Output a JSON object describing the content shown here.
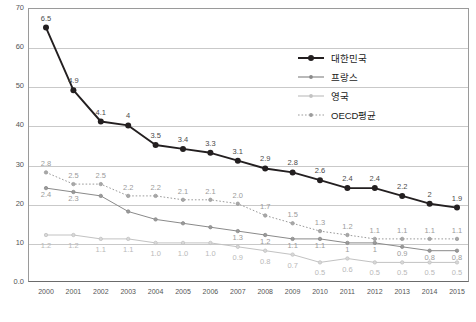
{
  "chart_data": {
    "type": "line",
    "title": "",
    "xlabel": "",
    "ylabel": "",
    "categories": [
      "2000",
      "2001",
      "2002",
      "2003",
      "2004",
      "2005",
      "2006",
      "2007",
      "2008",
      "2009",
      "2010",
      "2011",
      "2012",
      "2013",
      "2014",
      "2015"
    ],
    "ylim": [
      0,
      70
    ],
    "yticks": [
      "0.0",
      "10",
      "20",
      "30",
      "40",
      "50",
      "60",
      "70"
    ],
    "grid": true,
    "legend_position": "upper-right",
    "series": [
      {
        "name": "대한민국",
        "color": "#231f20",
        "style": "solid-thick-marker",
        "values": [
          6.5,
          4.9,
          4.1,
          4,
          3.5,
          3.4,
          3.3,
          3.1,
          2.9,
          2.8,
          2.6,
          2.4,
          2.4,
          2.2,
          2,
          1.9
        ],
        "labels": [
          "6.5",
          "4.9",
          "4.1",
          "4",
          "3.5",
          "3.4",
          "3.3",
          "3.1",
          "2.9",
          "2.8",
          "2.6",
          "2.4",
          "2.4",
          "2.2",
          "2",
          "1.9"
        ]
      },
      {
        "name": "프랑스",
        "color": "#8a8a8a",
        "style": "solid-thin-marker",
        "values": [
          2.4,
          2.3,
          2.2,
          1.8,
          1.6,
          1.5,
          1.4,
          1.3,
          1.2,
          1.1,
          1.1,
          1.0,
          1.0,
          0.9,
          0.8,
          0.8
        ],
        "labels": [
          "2.4",
          "2.3",
          "",
          "",
          "",
          "",
          "",
          "1.3",
          "1.2",
          "1.1",
          "1.1",
          "1",
          "1",
          "0.9",
          "0.8",
          "0.8"
        ]
      },
      {
        "name": "영국",
        "color": "#c2c2c2",
        "style": "solid-thin-marker",
        "values": [
          1.2,
          1.2,
          1.1,
          1.1,
          1.0,
          1.0,
          1.0,
          0.9,
          0.8,
          0.7,
          0.5,
          0.6,
          0.5,
          0.5,
          0.5,
          0.5
        ],
        "labels": [
          "1.2",
          "1.2",
          "1.1",
          "1.1",
          "1.0",
          "1.0",
          "1.0",
          "0.9",
          "0.8",
          "0.7",
          "0.5",
          "0.6",
          "0.5",
          "0.5",
          "0.5",
          "0.5"
        ]
      },
      {
        "name": "OECD평균",
        "color": "#9b9b9b",
        "style": "dotted-marker",
        "values": [
          2.8,
          2.5,
          2.5,
          2.2,
          2.2,
          2.1,
          2.1,
          2.0,
          1.7,
          1.5,
          1.3,
          1.2,
          1.1,
          1.1,
          1.1,
          1.1
        ],
        "labels": [
          "2.8",
          "2.5",
          "2.5",
          "2.2",
          "2.2",
          "2.1",
          "2.1",
          "2.0",
          "1.7",
          "1.5",
          "1.3",
          "1.2",
          "1.1",
          "1.1",
          "1.1",
          "1.1"
        ]
      }
    ]
  },
  "legend": {
    "items": [
      {
        "label": "대한민국"
      },
      {
        "label": "프랑스"
      },
      {
        "label": "영국"
      },
      {
        "label": "OECD평균"
      }
    ]
  }
}
